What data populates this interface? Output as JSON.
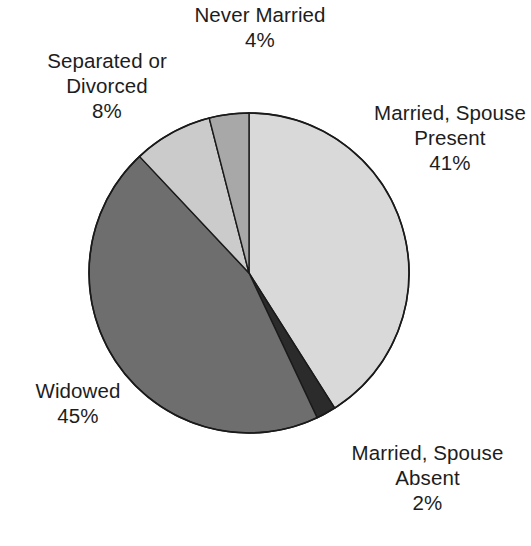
{
  "chart_data": {
    "type": "pie",
    "title": "",
    "subtitle": "",
    "xlabel": "",
    "ylabel": "",
    "legend_position": "none",
    "grid": false,
    "unit": "%",
    "start_angle_deg": 0,
    "direction": "clockwise",
    "categories": [
      "Married, Spouse Present",
      "Married, Spouse Absent",
      "Widowed",
      "Separated or Divorced",
      "Never Married"
    ],
    "values": [
      41,
      2,
      45,
      8,
      4
    ],
    "slices": [
      {
        "name": "married-spouse-present",
        "label_line1": "Married, Spouse",
        "label_line2": "Present",
        "value": 41,
        "percent_text": "41%",
        "color": "#d9d9d9"
      },
      {
        "name": "married-spouse-absent",
        "label_line1": "Married, Spouse",
        "label_line2": "Absent",
        "value": 2,
        "percent_text": "2%",
        "color": "#2b2b2b"
      },
      {
        "name": "widowed",
        "label_line1": "Widowed",
        "label_line2": "",
        "value": 45,
        "percent_text": "45%",
        "color": "#6e6e6e"
      },
      {
        "name": "separated-or-divorced",
        "label_line1": "Separated or",
        "label_line2": "Divorced",
        "value": 8,
        "percent_text": "8%",
        "color": "#cbcbcb"
      },
      {
        "name": "never-married",
        "label_line1": "Never Married",
        "label_line2": "",
        "value": 4,
        "percent_text": "4%",
        "color": "#a8a8a8"
      }
    ],
    "stroke_color": "#1a1a1a",
    "background_color": "#ffffff"
  },
  "geometry": {
    "center_x": 249,
    "center_y": 273,
    "radius": 160
  }
}
